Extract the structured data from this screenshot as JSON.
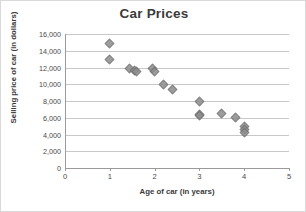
{
  "chart_data": {
    "type": "scatter",
    "title": "Car Prices",
    "xlabel": "Age of car (in years)",
    "ylabel": "Selling price of car (in dollars)",
    "xlim": [
      0,
      5
    ],
    "ylim": [
      0,
      16000
    ],
    "grid": "horizontal",
    "legend": "none",
    "marker": "diamond",
    "marker_color": "#8d8d8d",
    "xticks": [
      0,
      1,
      2,
      3,
      4,
      5
    ],
    "xtick_labels": [
      "0",
      "1",
      "2",
      "3",
      "4",
      "5"
    ],
    "yticks": [
      0,
      2000,
      4000,
      6000,
      8000,
      10000,
      12000,
      14000,
      16000
    ],
    "ytick_labels": [
      "0",
      "2,000",
      "4,000",
      "6,000",
      "8,000",
      "10,000",
      "12,000",
      "14,000",
      "16,000"
    ],
    "x": [
      1,
      1,
      1.45,
      1.55,
      1.6,
      1.95,
      2,
      2.2,
      2.4,
      3,
      3,
      3,
      3.5,
      3.8,
      4,
      4,
      4
    ],
    "y": [
      14900,
      12900,
      11900,
      11600,
      11500,
      11900,
      11500,
      9950,
      9400,
      7950,
      6400,
      6250,
      6500,
      6000,
      4900,
      4600,
      4250
    ],
    "points": [
      {
        "x": 1,
        "y": 14900
      },
      {
        "x": 1,
        "y": 12900
      },
      {
        "x": 1.45,
        "y": 11900
      },
      {
        "x": 1.55,
        "y": 11600
      },
      {
        "x": 1.6,
        "y": 11500
      },
      {
        "x": 1.95,
        "y": 11900
      },
      {
        "x": 2,
        "y": 11500
      },
      {
        "x": 2.2,
        "y": 9950
      },
      {
        "x": 2.4,
        "y": 9400
      },
      {
        "x": 3,
        "y": 7950
      },
      {
        "x": 3,
        "y": 6400
      },
      {
        "x": 3,
        "y": 6250
      },
      {
        "x": 3.5,
        "y": 6500
      },
      {
        "x": 3.8,
        "y": 6000
      },
      {
        "x": 4,
        "y": 4900
      },
      {
        "x": 4,
        "y": 4600
      },
      {
        "x": 4,
        "y": 4250
      }
    ]
  }
}
